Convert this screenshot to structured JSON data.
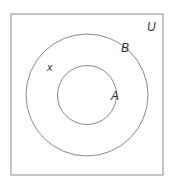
{
  "diagram": {
    "type": "venn",
    "universe": {
      "label": "U",
      "x": 11,
      "y": 14,
      "width": 152,
      "height": 161
    },
    "sets": [
      {
        "label": "B",
        "cx": 87,
        "cy": 95,
        "r": 61
      },
      {
        "label": "A",
        "cx": 87,
        "cy": 95,
        "r": 29.5
      }
    ],
    "elements": [
      {
        "label": "x",
        "x": 50,
        "y": 70
      }
    ],
    "relationship": "A ⊂ B ⊂ U",
    "stroke_color": "#888888",
    "label_color": "#333333"
  }
}
